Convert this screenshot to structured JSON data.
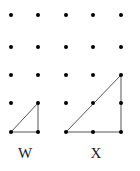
{
  "figure": {
    "type": "dot-grid-triangles",
    "width": 140,
    "height": 171,
    "background_color": "#ffffff",
    "dot_color": "#000000",
    "line_color": "#555555",
    "label_color": "#1a1a1a",
    "dot_radius": 2.0,
    "line_width": 1.0,
    "grid": {
      "columns": 5,
      "rows": 5,
      "x_positions": [
        11,
        38,
        66,
        93,
        121
      ],
      "y_positions": [
        15,
        47,
        75,
        103,
        132
      ],
      "x_spacing": 27.5,
      "y_spacing": 29.25
    },
    "shapes": [
      {
        "name": "triangle-w",
        "label": "W",
        "kind": "right-triangle",
        "legs": {
          "base_units": 1,
          "height_units": 1
        },
        "vertices_grid": [
          [
            0,
            4
          ],
          [
            1,
            4
          ],
          [
            1,
            3
          ]
        ],
        "vertices_px": [
          [
            11,
            132
          ],
          [
            38,
            132
          ],
          [
            38,
            103
          ]
        ]
      },
      {
        "name": "triangle-x",
        "label": "X",
        "kind": "right-triangle",
        "legs": {
          "base_units": 2,
          "height_units": 2
        },
        "vertices_grid": [
          [
            2,
            4
          ],
          [
            4,
            4
          ],
          [
            4,
            2
          ]
        ],
        "vertices_px": [
          [
            66,
            132
          ],
          [
            121,
            132
          ],
          [
            121,
            75
          ]
        ]
      }
    ]
  },
  "labels": {
    "left": "W",
    "right": "X"
  }
}
